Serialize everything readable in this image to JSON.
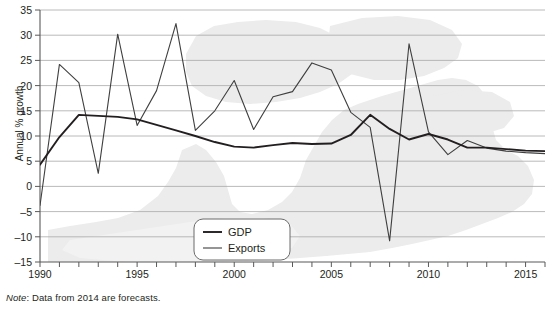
{
  "chart_data": {
    "type": "line",
    "title": "",
    "subtitle": "",
    "xlabel": "",
    "ylabel": "Annual % growth",
    "xlim": [
      1990,
      2016
    ],
    "ylim": [
      -15,
      35
    ],
    "ytick_step": 5,
    "yticks": [
      "35",
      "30",
      "25",
      "20",
      "15",
      "10",
      "5",
      "0",
      "–5",
      "–10",
      "–15"
    ],
    "xticks_labeled": [
      "1990",
      "1995",
      "2000",
      "2005",
      "2010",
      "2015"
    ],
    "xticks_all": [
      1990,
      1991,
      1992,
      1993,
      1994,
      1995,
      1996,
      1997,
      1998,
      1999,
      2000,
      2001,
      2002,
      2003,
      2004,
      2005,
      2006,
      2007,
      2008,
      2009,
      2010,
      2011,
      2012,
      2013,
      2014,
      2015,
      2016
    ],
    "grid": "horizontal",
    "legend_position": "bottom-center",
    "x": [
      1990,
      1991,
      1992,
      1993,
      1994,
      1995,
      1996,
      1997,
      1998,
      1999,
      2000,
      2001,
      2002,
      2003,
      2004,
      2005,
      2006,
      2007,
      2008,
      2009,
      2010,
      2011,
      2012,
      2013,
      2014,
      2015,
      2016
    ],
    "series": [
      {
        "name": "GDP",
        "color": "#231f20",
        "values": [
          4.3,
          9.8,
          14.2,
          14.0,
          13.8,
          13.3,
          12.2,
          11.1,
          10.0,
          8.8,
          7.9,
          7.7,
          8.2,
          8.6,
          8.4,
          8.5,
          10.2,
          14.2,
          11.4,
          9.3,
          10.4,
          9.3,
          7.7,
          7.7,
          7.4,
          7.1,
          7.0
        ]
      },
      {
        "name": "Exports",
        "color": "#3f3f3f",
        "values": [
          -3.8,
          24.2,
          20.6,
          2.6,
          30.2,
          12.1,
          19.0,
          32.3,
          11.1,
          15.0,
          21.0,
          11.3,
          17.8,
          18.8,
          24.5,
          23.1,
          14.7,
          11.7,
          -10.8,
          28.3,
          10.8,
          6.3,
          9.1,
          7.6,
          7.0,
          6.7,
          6.5
        ]
      }
    ],
    "note": {
      "label": "Note",
      "text": ": Data from 2014 are forecasts."
    },
    "watermark": "map-silhouette"
  }
}
